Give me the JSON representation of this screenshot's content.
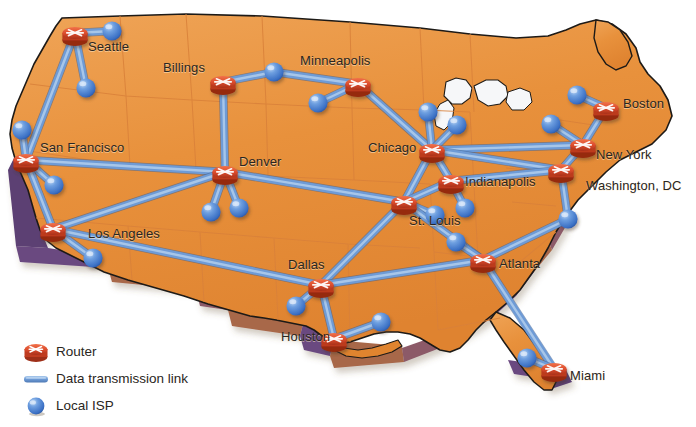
{
  "figure": {
    "background_color": "#ffffff",
    "map_fill_color": "#E8913C",
    "map_fill_color_light": "#F0A855",
    "map_edge_color": "#1d1a17",
    "map_extrude_brown": "#A8674A",
    "map_extrude_purple": "#5B3F73",
    "state_border_color": "#D9813A",
    "link_color": "#6E9BD6",
    "link_highlight_color": "#A8C7EA",
    "router_color": "#D94A2B",
    "router_color_dark": "#9E2F18",
    "isp_color": "#4E86D6",
    "isp_color_dark": "#2A5BA8"
  },
  "legend": {
    "items": [
      {
        "icon": "router-icon",
        "label": "Router"
      },
      {
        "icon": "link-icon",
        "label": "Data transmission link"
      },
      {
        "icon": "isp-sphere-icon",
        "label": "Local ISP"
      }
    ]
  },
  "network": {
    "routers": [
      {
        "id": "seattle",
        "label": "Seattle",
        "x": 75,
        "y": 33,
        "label_x": 88,
        "label_y": 47
      },
      {
        "id": "billings",
        "label": "Billings",
        "x": 223,
        "y": 82,
        "label_x": 163,
        "label_y": 68
      },
      {
        "id": "minneapolis",
        "label": "Minneapolis",
        "x": 358,
        "y": 84,
        "label_x": 300,
        "label_y": 61
      },
      {
        "id": "sanfrancisco",
        "label": "San Francisco",
        "x": 26,
        "y": 160,
        "label_x": 40,
        "label_y": 148
      },
      {
        "id": "denver",
        "label": "Denver",
        "x": 225,
        "y": 172,
        "label_x": 239,
        "label_y": 162
      },
      {
        "id": "chicago",
        "label": "Chicago",
        "x": 432,
        "y": 150,
        "label_x": 368,
        "label_y": 148
      },
      {
        "id": "boston",
        "label": "Boston",
        "x": 606,
        "y": 108,
        "label_x": 623,
        "label_y": 104
      },
      {
        "id": "newyork",
        "label": "New York",
        "x": 583,
        "y": 145,
        "label_x": 596,
        "label_y": 155
      },
      {
        "id": "washington",
        "label": "Washington, DC",
        "x": 561,
        "y": 170,
        "label_x": 586,
        "label_y": 186
      },
      {
        "id": "indianapolis",
        "label": "Indianapolis",
        "x": 451,
        "y": 181,
        "label_x": 465,
        "label_y": 182
      },
      {
        "id": "stlouis",
        "label": "St. Louis",
        "x": 404,
        "y": 202,
        "label_x": 409,
        "label_y": 221
      },
      {
        "id": "losangeles",
        "label": "Los Angeles",
        "x": 53,
        "y": 229,
        "label_x": 88,
        "label_y": 234
      },
      {
        "id": "atlanta",
        "label": "Atlanta",
        "x": 483,
        "y": 260,
        "label_x": 499,
        "label_y": 264
      },
      {
        "id": "dallas",
        "label": "Dallas",
        "x": 321,
        "y": 285,
        "label_x": 288,
        "label_y": 265
      },
      {
        "id": "houston",
        "label": "Houston",
        "x": 334,
        "y": 339,
        "label_x": 281,
        "label_y": 337
      },
      {
        "id": "miami",
        "label": "Miami",
        "x": 554,
        "y": 369,
        "label_x": 570,
        "label_y": 376
      }
    ],
    "isps": [
      {
        "id": "isp-seattle-e",
        "x": 112,
        "y": 31
      },
      {
        "id": "isp-seattle-s",
        "x": 86,
        "y": 88
      },
      {
        "id": "isp-billings-e",
        "x": 274,
        "y": 72
      },
      {
        "id": "isp-minn-w",
        "x": 318,
        "y": 103
      },
      {
        "id": "isp-sf-n",
        "x": 22,
        "y": 130
      },
      {
        "id": "isp-sf-se",
        "x": 54,
        "y": 185
      },
      {
        "id": "isp-denver-sw",
        "x": 211,
        "y": 212
      },
      {
        "id": "isp-denver-se",
        "x": 239,
        "y": 208
      },
      {
        "id": "isp-chicago-nw",
        "x": 428,
        "y": 112
      },
      {
        "id": "isp-chicago-ne",
        "x": 457,
        "y": 125
      },
      {
        "id": "isp-boston-nw",
        "x": 577,
        "y": 95
      },
      {
        "id": "isp-newyork-nw",
        "x": 551,
        "y": 124
      },
      {
        "id": "isp-indy-se",
        "x": 465,
        "y": 208
      },
      {
        "id": "isp-stlouis-se",
        "x": 435,
        "y": 215
      },
      {
        "id": "isp-atlanta-nw",
        "x": 456,
        "y": 242
      },
      {
        "id": "isp-dc-se",
        "x": 568,
        "y": 219
      },
      {
        "id": "isp-la-se",
        "x": 93,
        "y": 258
      },
      {
        "id": "isp-dallas-sw",
        "x": 296,
        "y": 306
      },
      {
        "id": "isp-houston-e",
        "x": 381,
        "y": 322
      },
      {
        "id": "isp-miami-nw",
        "x": 527,
        "y": 358
      }
    ],
    "links": [
      {
        "from": "seattle",
        "to": "sanfrancisco"
      },
      {
        "from": "seattle",
        "to": "isp-seattle-e"
      },
      {
        "from": "seattle",
        "to": "isp-seattle-s"
      },
      {
        "from": "billings",
        "to": "denver"
      },
      {
        "from": "billings",
        "to": "isp-billings-e"
      },
      {
        "from": "isp-billings-e",
        "to": "minneapolis"
      },
      {
        "from": "minneapolis",
        "to": "isp-minn-w"
      },
      {
        "from": "minneapolis",
        "to": "chicago"
      },
      {
        "from": "sanfrancisco",
        "to": "isp-sf-n"
      },
      {
        "from": "sanfrancisco",
        "to": "isp-sf-se"
      },
      {
        "from": "sanfrancisco",
        "to": "denver"
      },
      {
        "from": "sanfrancisco",
        "to": "losangeles"
      },
      {
        "from": "denver",
        "to": "isp-denver-sw"
      },
      {
        "from": "denver",
        "to": "isp-denver-se"
      },
      {
        "from": "denver",
        "to": "stlouis"
      },
      {
        "from": "denver",
        "to": "losangeles"
      },
      {
        "from": "losangeles",
        "to": "isp-la-se"
      },
      {
        "from": "losangeles",
        "to": "dallas"
      },
      {
        "from": "chicago",
        "to": "isp-chicago-nw"
      },
      {
        "from": "chicago",
        "to": "isp-chicago-ne"
      },
      {
        "from": "chicago",
        "to": "indianapolis"
      },
      {
        "from": "chicago",
        "to": "stlouis"
      },
      {
        "from": "chicago",
        "to": "newyork"
      },
      {
        "from": "chicago",
        "to": "washington"
      },
      {
        "from": "stlouis",
        "to": "indianapolis"
      },
      {
        "from": "stlouis",
        "to": "isp-stlouis-se"
      },
      {
        "from": "stlouis",
        "to": "dallas"
      },
      {
        "from": "stlouis",
        "to": "atlanta"
      },
      {
        "from": "indianapolis",
        "to": "isp-indy-se"
      },
      {
        "from": "indianapolis",
        "to": "washington"
      },
      {
        "from": "boston",
        "to": "isp-boston-nw"
      },
      {
        "from": "boston",
        "to": "newyork"
      },
      {
        "from": "newyork",
        "to": "isp-newyork-nw"
      },
      {
        "from": "newyork",
        "to": "washington"
      },
      {
        "from": "washington",
        "to": "isp-dc-se"
      },
      {
        "from": "isp-dc-se",
        "to": "atlanta"
      },
      {
        "from": "atlanta",
        "to": "isp-atlanta-nw"
      },
      {
        "from": "atlanta",
        "to": "dallas"
      },
      {
        "from": "atlanta",
        "to": "miami"
      },
      {
        "from": "dallas",
        "to": "isp-dallas-sw"
      },
      {
        "from": "dallas",
        "to": "houston"
      },
      {
        "from": "houston",
        "to": "isp-houston-e"
      },
      {
        "from": "miami",
        "to": "isp-miami-nw"
      }
    ]
  }
}
